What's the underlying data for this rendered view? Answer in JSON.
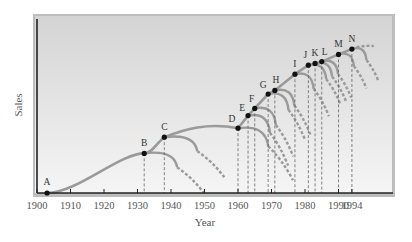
{
  "chart_data": {
    "type": "line",
    "title": "",
    "xlabel": "Year",
    "ylabel": "Sales",
    "xlim": [
      1900,
      1998
    ],
    "x_ticks": [
      1900,
      1910,
      1920,
      1930,
      1940,
      1950,
      1960,
      1970,
      1980,
      1990,
      1994
    ],
    "x_tick_labels": [
      "1900",
      "1910",
      "1920",
      "1930",
      "1940",
      "1950",
      "1960",
      "1970",
      "1980",
      "1990",
      "1994"
    ],
    "y_ticks": [],
    "grid": false,
    "legend": null,
    "points": [
      {
        "label": "A",
        "year": 1903,
        "relative_sales": 0.0
      },
      {
        "label": "B",
        "year": 1932,
        "relative_sales": 0.22
      },
      {
        "label": "C",
        "year": 1938,
        "relative_sales": 0.31
      },
      {
        "label": "D",
        "year": 1960,
        "relative_sales": 0.36
      },
      {
        "label": "E",
        "year": 1963,
        "relative_sales": 0.43
      },
      {
        "label": "F",
        "year": 1965,
        "relative_sales": 0.47
      },
      {
        "label": "G",
        "year": 1969,
        "relative_sales": 0.55
      },
      {
        "label": "H",
        "year": 1971,
        "relative_sales": 0.57
      },
      {
        "label": "I",
        "year": 1977,
        "relative_sales": 0.66
      },
      {
        "label": "J",
        "year": 1981,
        "relative_sales": 0.71
      },
      {
        "label": "K",
        "year": 1983,
        "relative_sales": 0.72
      },
      {
        "label": "L",
        "year": 1985,
        "relative_sales": 0.73
      },
      {
        "label": "M",
        "year": 1990,
        "relative_sales": 0.77
      },
      {
        "label": "N",
        "year": 1994,
        "relative_sales": 0.8
      }
    ],
    "annotations": "Envelope curve of successive S-curves; each lettered point marks a new technology/product curve, with dashed projections of declining prior curves and dashed vertical drop lines to the year axis."
  },
  "colors": {
    "plot_bg_top": "#d6d6d6",
    "plot_bg_bottom": "#f4f4f4",
    "curve": "#9a9a9a",
    "point": "#111111",
    "axis": "#222222"
  }
}
